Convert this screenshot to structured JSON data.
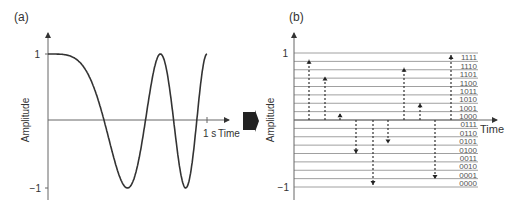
{
  "panels": {
    "a": {
      "label": "(a)",
      "ylabel": "Amplitude",
      "xlabel": "Time",
      "x_tick_label": "1 s",
      "y_ticks": [
        "1",
        "−1"
      ]
    },
    "b": {
      "label": "(b)",
      "ylabel": "Amplitude",
      "xlabel": "Time",
      "y_ticks": [
        "1",
        "−1"
      ],
      "codes": [
        "1111",
        "1110",
        "1101",
        "1100",
        "1011",
        "1010",
        "1001",
        "1000",
        "0111",
        "0110",
        "0101",
        "0100",
        "0011",
        "0010",
        "0001",
        "0000"
      ]
    }
  },
  "arrow": {
    "icon": "block-arrow-right-icon",
    "color": "#222222"
  },
  "chart_data": [
    {
      "type": "line",
      "title": "(a) Continuous analog signal (chirp)",
      "xlabel": "Time",
      "ylabel": "Amplitude",
      "x_tick": "1 s",
      "xlim": [
        0,
        1
      ],
      "ylim": [
        -1,
        1
      ],
      "function": "cos(4*pi*t^2)",
      "x": [
        0,
        0.1,
        0.2,
        0.3,
        0.354,
        0.4,
        0.5,
        0.6,
        0.612,
        0.7,
        0.707,
        0.79,
        0.8,
        0.866,
        0.9,
        0.935,
        1.0
      ],
      "values": [
        1.0,
        0.99,
        0.88,
        0.36,
        0.0,
        -0.37,
        -1.0,
        -0.22,
        0.0,
        0.99,
        1.0,
        0.0,
        -0.31,
        -1.0,
        -0.67,
        0.0,
        1.0
      ]
    },
    {
      "type": "stem",
      "title": "(b) Sampled and 4-bit quantized signal",
      "xlabel": "Time",
      "ylabel": "Amplitude",
      "ylim": [
        -1,
        1
      ],
      "quantization_levels": 16,
      "level_codes": [
        "0000",
        "0001",
        "0010",
        "0011",
        "0100",
        "0101",
        "0110",
        "0111",
        "1000",
        "1001",
        "1010",
        "1011",
        "1100",
        "1101",
        "1110",
        "1111"
      ],
      "sample_index": [
        1,
        2,
        3,
        4,
        5,
        6,
        7,
        8,
        9,
        10
      ],
      "values": [
        0.9,
        0.65,
        0.1,
        -0.5,
        -0.97,
        -0.35,
        0.78,
        0.25,
        -0.88,
        0.97
      ],
      "grid": true
    }
  ]
}
